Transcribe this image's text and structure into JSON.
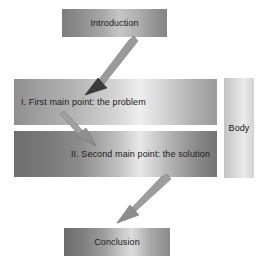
{
  "diagram": {
    "title_semantic": "speech-outline-flow",
    "boxes": {
      "introduction": {
        "label": "Introduction"
      },
      "first_point": {
        "label": "I. First main point: the problem"
      },
      "second_point": {
        "label": "II. Second main point: the solution"
      },
      "conclusion": {
        "label": "Conclusion"
      }
    },
    "bracket": {
      "label": "Body"
    },
    "arrows": [
      {
        "name": "intro-to-first-point",
        "from": "Introduction",
        "to": "I. First main point: the problem",
        "direction": "down-left"
      },
      {
        "name": "first-point-to-second-point",
        "from": "I. First main point: the problem",
        "to": "II. Second main point: the solution",
        "direction": "down-right"
      },
      {
        "name": "second-point-to-conclusion",
        "from": "II. Second main point: the solution",
        "to": "Conclusion",
        "direction": "down-left"
      }
    ],
    "colors": {
      "arrow_fill": "#9a9a9a",
      "arrow_stroke": "#7e7e7e",
      "text": "#1a1a1a",
      "background": "#ffffff"
    }
  }
}
